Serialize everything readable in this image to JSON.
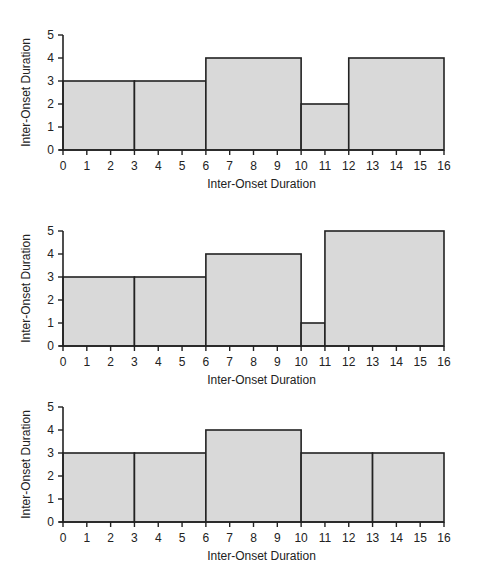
{
  "chart_data": [
    {
      "type": "bar",
      "title": "",
      "xlabel": "Inter-Onset Duration",
      "ylabel": "Inter-Onset Duration",
      "xlim": [
        0,
        16
      ],
      "ylim": [
        0,
        5
      ],
      "x_ticks": [
        0,
        1,
        2,
        3,
        4,
        5,
        6,
        7,
        8,
        9,
        10,
        11,
        12,
        13,
        14,
        15,
        16
      ],
      "y_ticks": [
        0,
        1,
        2,
        3,
        4,
        5
      ],
      "grid": false,
      "bars": [
        {
          "start": 0,
          "end": 3,
          "value": 3
        },
        {
          "start": 3,
          "end": 6,
          "value": 3
        },
        {
          "start": 6,
          "end": 10,
          "value": 4
        },
        {
          "start": 10,
          "end": 12,
          "value": 2
        },
        {
          "start": 12,
          "end": 16,
          "value": 4
        }
      ],
      "fill_color": "#d9d9d9",
      "edge_color": "#222222"
    },
    {
      "type": "bar",
      "title": "",
      "xlabel": "Inter-Onset Duration",
      "ylabel": "Inter-Onset Duration",
      "xlim": [
        0,
        16
      ],
      "ylim": [
        0,
        5
      ],
      "x_ticks": [
        0,
        1,
        2,
        3,
        4,
        5,
        6,
        7,
        8,
        9,
        10,
        11,
        12,
        13,
        14,
        15,
        16
      ],
      "y_ticks": [
        0,
        1,
        2,
        3,
        4,
        5
      ],
      "grid": false,
      "bars": [
        {
          "start": 0,
          "end": 3,
          "value": 3
        },
        {
          "start": 3,
          "end": 6,
          "value": 3
        },
        {
          "start": 6,
          "end": 10,
          "value": 4
        },
        {
          "start": 10,
          "end": 11,
          "value": 1
        },
        {
          "start": 11,
          "end": 16,
          "value": 5
        }
      ],
      "fill_color": "#d9d9d9",
      "edge_color": "#222222"
    },
    {
      "type": "bar",
      "title": "",
      "xlabel": "Inter-Onset Duration",
      "ylabel": "Inter-Onset Duration",
      "xlim": [
        0,
        16
      ],
      "ylim": [
        0,
        5
      ],
      "x_ticks": [
        0,
        1,
        2,
        3,
        4,
        5,
        6,
        7,
        8,
        9,
        10,
        11,
        12,
        13,
        14,
        15,
        16
      ],
      "y_ticks": [
        0,
        1,
        2,
        3,
        4,
        5
      ],
      "grid": false,
      "bars": [
        {
          "start": 0,
          "end": 3,
          "value": 3
        },
        {
          "start": 3,
          "end": 6,
          "value": 3
        },
        {
          "start": 6,
          "end": 10,
          "value": 4
        },
        {
          "start": 10,
          "end": 13,
          "value": 3
        },
        {
          "start": 13,
          "end": 16,
          "value": 3
        }
      ],
      "fill_color": "#d9d9d9",
      "edge_color": "#222222"
    }
  ],
  "layout": {
    "panels": [
      {
        "x0": 63,
        "x1": 444,
        "y_top": 35,
        "y_base": 150,
        "xlabel_y": 188,
        "ylabel_x": 30
      },
      {
        "x0": 63,
        "x1": 444,
        "y_top": 231,
        "y_base": 346,
        "xlabel_y": 384,
        "ylabel_x": 30
      },
      {
        "x0": 63,
        "x1": 444,
        "y_top": 407,
        "y_base": 522,
        "xlabel_y": 560,
        "ylabel_x": 30
      }
    ]
  }
}
